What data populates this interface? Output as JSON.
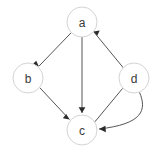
{
  "figure": {
    "type": "directed-graph",
    "background_color": "#ffffff",
    "width": 156,
    "height": 154
  },
  "style": {
    "node_fill": "#ffffff",
    "node_stroke": "#d4d4d4",
    "node_radius": 15,
    "label_color": "#3a3a3a",
    "edge_color": "#555555",
    "arrow_color": "#2b2b2b"
  },
  "nodes": [
    {
      "id": "a",
      "label": "a",
      "cx": 82,
      "cy": 22,
      "r": 15
    },
    {
      "id": "b",
      "label": "b",
      "cx": 28,
      "cy": 78,
      "r": 15
    },
    {
      "id": "c",
      "label": "c",
      "cx": 82,
      "cy": 130,
      "r": 15
    },
    {
      "id": "d",
      "label": "d",
      "cx": 134,
      "cy": 78,
      "r": 15
    }
  ],
  "edges": [
    {
      "id": "a-b",
      "from": "a",
      "to": "b",
      "shape": "straight",
      "directed": true
    },
    {
      "id": "a-c",
      "from": "a",
      "to": "c",
      "shape": "straight",
      "directed": true
    },
    {
      "id": "b-c",
      "from": "b",
      "to": "c",
      "shape": "straight",
      "directed": true
    },
    {
      "id": "c-d",
      "from": "c",
      "to": "d",
      "shape": "straight",
      "directed": true
    },
    {
      "id": "d-c",
      "from": "d",
      "to": "c",
      "shape": "curved",
      "directed": true
    },
    {
      "id": "d-a",
      "from": "d",
      "to": "a",
      "shape": "straight",
      "directed": true
    }
  ],
  "paths": {
    "a_b": "M 71.5 32.4 L 38.8 66.3",
    "a_c": "M 82 37 L 82 113",
    "b_c": "M 39.5 87.4 L 69.5 119.5",
    "c_d": "M 94.8 121.9 L 122.5 88.5",
    "d_a": "M 123.8 68.4 L 93.5 31.5",
    "d_c_curve": "M 139.5 92.3 C 147 110 143 124 99 129",
    "arrow_a_b": "M 38.8 66.3 L 32.4 64.4 L 36.2 60.7 Z",
    "arrow_a_c": "M 82 113 L 78.6 107.2 L 85.4 107.2 Z",
    "arrow_b_c": "M 69.5 119.5 L 62.9 118.2 L 66.2 114.1 Z",
    "arrow_c_d": "M 122.5 88.5 L 126.3 82.9 L 129.1 87.4 Z",
    "arrow_d_a": "M 93.5 31.5 L 99.7 30.4 L 97.2 35.8 Z",
    "arrow_d_c": "M 99 129 L 105.4 125.8 L 105.9 132.3 Z"
  }
}
